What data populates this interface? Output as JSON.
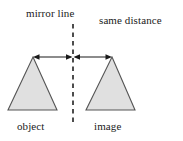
{
  "diagram": {
    "colors": {
      "shape_fill": "#e0e0e0",
      "shape_stroke": "#555555",
      "mirror_line": "#4d4d4d",
      "arrow": "#1a1a1a",
      "text": "#1a1a1a",
      "background": "#ffffff"
    },
    "labels": {
      "mirror_line": "mirror line",
      "same_distance": "same distance",
      "object": "object",
      "image": "image"
    },
    "shapes": {
      "object_triangle": {
        "apex": [
          33,
          57
        ],
        "base_left": [
          8,
          110
        ],
        "base_right": [
          57,
          110
        ]
      },
      "image_triangle": {
        "apex": [
          112,
          57
        ],
        "base_left": [
          86,
          110
        ],
        "base_right": [
          135,
          110
        ]
      }
    },
    "mirror_axis": {
      "x": 73,
      "y_top": 24,
      "y_bottom": 122,
      "style": "dashed"
    },
    "measure": {
      "y": 57,
      "left_segment": [
        33,
        73
      ],
      "right_segment": [
        73,
        112
      ],
      "arrowheads": [
        "left-outer",
        "center-left",
        "center-right",
        "right-outer"
      ]
    }
  }
}
